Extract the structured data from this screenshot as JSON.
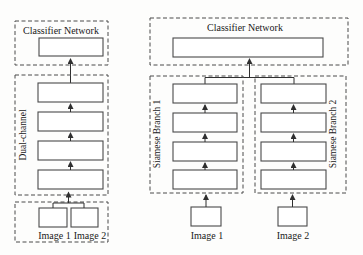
{
  "left_diagram": {
    "classifier_label": "Classifier Network",
    "channel_label": "Dual-channel",
    "channel_layer_count": 4,
    "input1_label": "Image 1",
    "input2_label": "Image 2"
  },
  "right_diagram": {
    "classifier_label": "Classifier Network",
    "branch1_label": "Siamese Branch 1",
    "branch2_label": "Siamese Branch 2",
    "branch_layer_count": 4,
    "input1_label": "Image 1",
    "input2_label": "Image 2"
  },
  "colors": {
    "background": "#fdfdfc",
    "line_stroke": "#4a4a4a",
    "arrow_stroke": "#2f2f2f",
    "text": "#1a1a1a",
    "layer_fill": "#ffffff"
  }
}
